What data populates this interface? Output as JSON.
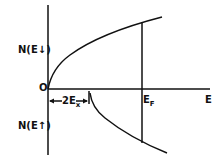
{
  "diagram": {
    "y_label_upper": "N(E↓)",
    "y_label_lower": "N(E↑)",
    "origin_label": "O",
    "x_axis_label": "E",
    "fermi_label": "E",
    "fermi_sub": "F",
    "exchange_label": "2E",
    "exchange_sub": "x",
    "line_color": "#111111"
  }
}
